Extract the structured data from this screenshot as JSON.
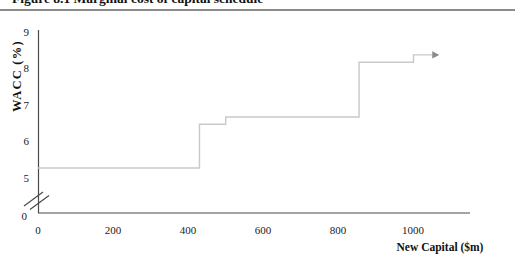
{
  "figure": {
    "caption_cropped_text": "Figure 8.1 Marginal cost of capital schedule"
  },
  "chart_data": {
    "type": "line",
    "subtype": "step-function",
    "title": "",
    "xlabel": "New Capital ($m)",
    "ylabel": "WACC (%)",
    "x_ticks": [
      0,
      200,
      400,
      600,
      800,
      1000
    ],
    "x_tick_labels": [
      "0",
      "200",
      "400",
      "600",
      "800",
      "1000"
    ],
    "y_ticks": [
      9,
      8,
      7,
      6,
      5,
      0
    ],
    "y_tick_labels": [
      "9",
      "8",
      "7",
      "6",
      "5",
      "0"
    ],
    "xlim": [
      0,
      1150
    ],
    "ylim": [
      0,
      9
    ],
    "axis_break_on_y": true,
    "grid": false,
    "legend": "none",
    "line_color": "#c9c9c9",
    "arrow_color": "#8a8a8a",
    "axis_color": "#4a4a4a",
    "segments": [
      {
        "from": 0,
        "to": 430,
        "wacc": 5.3
      },
      {
        "from": 430,
        "to": 500,
        "wacc": 6.5
      },
      {
        "from": 500,
        "to": 855,
        "wacc": 6.7
      },
      {
        "from": 855,
        "to": 1000,
        "wacc": 8.2
      },
      {
        "from": 1000,
        "to": 1050,
        "wacc": 8.4,
        "arrow": true
      }
    ]
  }
}
